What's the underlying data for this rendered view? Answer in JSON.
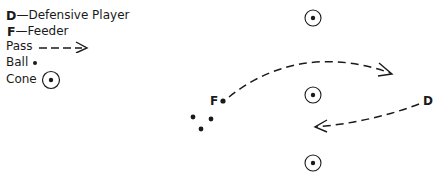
{
  "legend": {
    "items": [
      {
        "key": "D",
        "label": "—Defensive Player"
      },
      {
        "key": "F",
        "label": "—Feeder"
      },
      {
        "key": "",
        "label": "Pass",
        "symbol": "dashed-arrow-icon"
      },
      {
        "key": "",
        "label": "Ball",
        "symbol": "ball-icon"
      },
      {
        "key": "",
        "label": "Cone",
        "symbol": "cone-icon"
      }
    ]
  },
  "diagram": {
    "feeder_label": "F",
    "defender_label": "D",
    "cones": [
      {
        "x": 313,
        "y": 18
      },
      {
        "x": 313,
        "y": 95
      },
      {
        "x": 313,
        "y": 163
      }
    ],
    "balls": [
      {
        "x": 193,
        "y": 117
      },
      {
        "x": 211,
        "y": 119
      },
      {
        "x": 201,
        "y": 129
      }
    ],
    "feeder": {
      "x": 223,
      "y": 101
    },
    "defender": {
      "x": 427,
      "y": 101
    },
    "colors": {
      "ink": "#1a1a1a",
      "background": "#ffffff"
    }
  }
}
